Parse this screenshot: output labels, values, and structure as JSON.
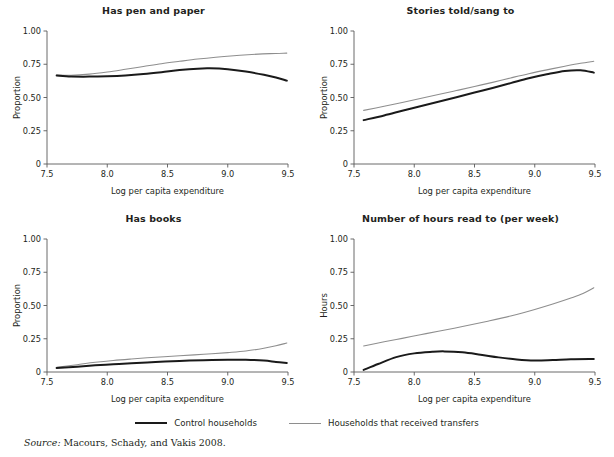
{
  "figure": {
    "source_label": "Source:",
    "source_text": " Macours, Schady, and Vakis 2008."
  },
  "legend": {
    "items": [
      {
        "label": "Control households",
        "color": "#1a1a1a",
        "width": 2.4
      },
      {
        "label": "Households that received transfers",
        "color": "#8e8e8e",
        "width": 1.4
      }
    ]
  },
  "chart_data": [
    {
      "type": "line",
      "title": "Has pen and paper",
      "xlabel": "Log per capita expenditure",
      "ylabel": "Proportion",
      "xlim": [
        7.58,
        9.5
      ],
      "ylim": [
        0,
        1.0
      ],
      "xticks": [
        7.5,
        8.0,
        8.5,
        9.0,
        9.5
      ],
      "xticklabels": [
        "7.5",
        "8.0",
        "8.5",
        "9.0",
        "9.5"
      ],
      "yticks": [
        0,
        0.25,
        0.5,
        0.75,
        1.0
      ],
      "yticklabels": [
        "0",
        "0.25",
        "0.50",
        "0.75",
        "1.00"
      ],
      "grid": false,
      "legend_position": "below-figure",
      "series": [
        {
          "name": "Control households",
          "color": "#1a1a1a",
          "x": [
            7.58,
            7.7,
            7.85,
            8.0,
            8.15,
            8.3,
            8.45,
            8.6,
            8.75,
            8.85,
            9.0,
            9.15,
            9.3,
            9.4,
            9.49
          ],
          "values": [
            0.665,
            0.658,
            0.657,
            0.66,
            0.666,
            0.676,
            0.69,
            0.706,
            0.717,
            0.719,
            0.712,
            0.695,
            0.671,
            0.65,
            0.627
          ]
        },
        {
          "name": "Households that received transfers",
          "color": "#8e8e8e",
          "x": [
            7.58,
            7.7,
            7.85,
            8.0,
            8.15,
            8.3,
            8.45,
            8.6,
            8.75,
            8.9,
            9.05,
            9.2,
            9.35,
            9.49
          ],
          "values": [
            0.669,
            0.667,
            0.676,
            0.692,
            0.712,
            0.733,
            0.754,
            0.772,
            0.789,
            0.803,
            0.814,
            0.823,
            0.83,
            0.834
          ]
        }
      ]
    },
    {
      "type": "line",
      "title": "Stories told/sang to",
      "xlabel": "Log per capita expenditure",
      "ylabel": "Proportion",
      "xlim": [
        7.58,
        9.5
      ],
      "ylim": [
        0,
        1.0
      ],
      "xticks": [
        7.5,
        8.0,
        8.5,
        9.0,
        9.5
      ],
      "xticklabels": [
        "7.5",
        "8.0",
        "8.5",
        "9.0",
        "9.5"
      ],
      "yticks": [
        0,
        0.25,
        0.5,
        0.75,
        1.0
      ],
      "yticklabels": [
        "0",
        "0.25",
        "0.50",
        "0.75",
        "1.00"
      ],
      "grid": false,
      "legend_position": "below-figure",
      "series": [
        {
          "name": "Control households",
          "color": "#1a1a1a",
          "x": [
            7.58,
            7.75,
            7.9,
            8.05,
            8.2,
            8.35,
            8.5,
            8.65,
            8.8,
            8.95,
            9.1,
            9.25,
            9.38,
            9.49
          ],
          "values": [
            0.33,
            0.365,
            0.4,
            0.434,
            0.468,
            0.502,
            0.537,
            0.572,
            0.608,
            0.645,
            0.675,
            0.7,
            0.705,
            0.687
          ]
        },
        {
          "name": "Households that received transfers",
          "color": "#8e8e8e",
          "x": [
            7.58,
            7.75,
            7.9,
            8.05,
            8.2,
            8.35,
            8.5,
            8.65,
            8.8,
            8.95,
            9.1,
            9.25,
            9.38,
            9.49
          ],
          "values": [
            0.403,
            0.434,
            0.463,
            0.493,
            0.522,
            0.552,
            0.583,
            0.614,
            0.647,
            0.679,
            0.708,
            0.735,
            0.757,
            0.772
          ]
        }
      ]
    },
    {
      "type": "line",
      "title": "Has books",
      "xlabel": "Log per capita expenditure",
      "ylabel": "Proportion",
      "xlim": [
        7.58,
        9.5
      ],
      "ylim": [
        0,
        1.0
      ],
      "xticks": [
        7.5,
        8.0,
        8.5,
        9.0,
        9.5
      ],
      "xticklabels": [
        "7.5",
        "8.0",
        "8.5",
        "9.0",
        "9.5"
      ],
      "yticks": [
        0,
        0.25,
        0.5,
        0.75,
        1.0
      ],
      "yticklabels": [
        "0",
        "0.25",
        "0.50",
        "0.75",
        "1.00"
      ],
      "grid": false,
      "legend_position": "below-figure",
      "series": [
        {
          "name": "Control households",
          "color": "#1a1a1a",
          "x": [
            7.58,
            7.75,
            7.9,
            8.05,
            8.2,
            8.4,
            8.6,
            8.8,
            9.0,
            9.15,
            9.3,
            9.4,
            9.49
          ],
          "values": [
            0.031,
            0.04,
            0.05,
            0.058,
            0.065,
            0.075,
            0.083,
            0.089,
            0.092,
            0.092,
            0.086,
            0.076,
            0.068
          ]
        },
        {
          "name": "Households that received transfers",
          "color": "#8e8e8e",
          "x": [
            7.58,
            7.75,
            7.9,
            8.05,
            8.2,
            8.4,
            8.6,
            8.8,
            9.0,
            9.15,
            9.3,
            9.4,
            9.49
          ],
          "values": [
            0.035,
            0.055,
            0.073,
            0.087,
            0.098,
            0.111,
            0.122,
            0.133,
            0.146,
            0.158,
            0.179,
            0.197,
            0.218
          ]
        }
      ]
    },
    {
      "type": "line",
      "title": "Number of hours read to (per week)",
      "xlabel": "Log per capita expenditure",
      "ylabel": "Hours",
      "xlim": [
        7.58,
        9.5
      ],
      "ylim": [
        0,
        1.0
      ],
      "xticks": [
        7.5,
        8.0,
        8.5,
        9.0,
        9.5
      ],
      "xticklabels": [
        "7.5",
        "8.0",
        "8.5",
        "9.0",
        "9.5"
      ],
      "yticks": [
        0,
        0.25,
        0.5,
        0.75,
        1.0
      ],
      "yticklabels": [
        "0",
        "0.25",
        "0.50",
        "0.75",
        "1.00"
      ],
      "grid": false,
      "legend_position": "below-figure",
      "series": [
        {
          "name": "Control households",
          "color": "#1a1a1a",
          "x": [
            7.58,
            7.7,
            7.85,
            8.0,
            8.15,
            8.25,
            8.4,
            8.55,
            8.7,
            8.85,
            9.0,
            9.15,
            9.3,
            9.49
          ],
          "values": [
            0.016,
            0.06,
            0.112,
            0.14,
            0.152,
            0.155,
            0.148,
            0.13,
            0.11,
            0.094,
            0.086,
            0.09,
            0.096,
            0.098
          ]
        },
        {
          "name": "Households that received transfers",
          "color": "#8e8e8e",
          "x": [
            7.58,
            7.75,
            7.9,
            8.05,
            8.2,
            8.4,
            8.6,
            8.8,
            9.0,
            9.15,
            9.3,
            9.4,
            9.49
          ],
          "values": [
            0.196,
            0.227,
            0.253,
            0.28,
            0.306,
            0.342,
            0.38,
            0.421,
            0.47,
            0.511,
            0.556,
            0.59,
            0.633
          ]
        }
      ]
    }
  ]
}
